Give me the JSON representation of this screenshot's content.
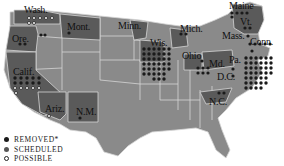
{
  "map": {
    "type": "US state map",
    "colors": {
      "base_state": "#8a8a8a",
      "highlight_state": "#5a5a5a",
      "border": "#d6d6d6",
      "removed": "#1a1a1a",
      "scheduled": "#555555",
      "possible": "#ffffff"
    }
  },
  "labels": {
    "wash": "Wash.",
    "ore": "Ore.",
    "calif": "Calif.",
    "mont": "Mont.",
    "minn": "Minn.",
    "wis": "Wis.",
    "mich": "Mich.",
    "ohio": "Ohio",
    "md": "Md.",
    "pa": "Pa.",
    "dc": "D.C.",
    "maine": "Maine",
    "vt": "Vt.",
    "mass": "Mass.",
    "conn": "Conn.",
    "ariz": "Ariz.",
    "nm": "N.M.",
    "nc": "N.C."
  },
  "legend": {
    "removed": "REMOVED*",
    "scheduled": "SCHEDULED",
    "possible": "POSSIBLE"
  }
}
